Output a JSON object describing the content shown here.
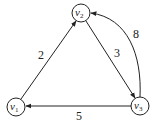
{
  "graph": {
    "type": "directed weighted graph",
    "nodes": [
      {
        "id": "v1",
        "name": "v",
        "sub": "1",
        "x": 16,
        "y": 107
      },
      {
        "id": "v2",
        "name": "v",
        "sub": "2",
        "x": 81,
        "y": 13
      },
      {
        "id": "v3",
        "name": "v",
        "sub": "3",
        "x": 140,
        "y": 106
      }
    ],
    "edges": [
      {
        "from": "v1",
        "to": "v2",
        "weight": "2"
      },
      {
        "from": "v2",
        "to": "v3",
        "weight": "3"
      },
      {
        "from": "v3",
        "to": "v2",
        "weight": "8",
        "curved": true
      },
      {
        "from": "v3",
        "to": "v1",
        "weight": "5"
      }
    ]
  }
}
